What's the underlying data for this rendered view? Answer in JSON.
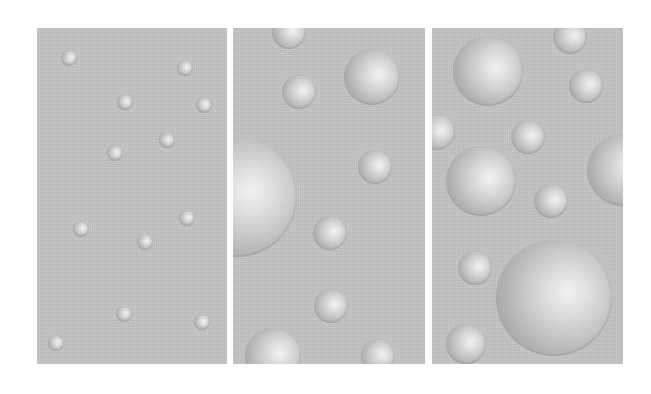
{
  "figure": {
    "background": "#ffffff",
    "panel_color": "#c3c3c3",
    "sphere_highlight": "#f2f2f2",
    "sphere_shadow": "#8f8f8f",
    "panels": [
      {
        "name": "panel-small-spheres",
        "x": 37,
        "y": 28,
        "width": 190,
        "height": 336,
        "spheres": [
          {
            "cx": 69,
            "cy": 58,
            "r": 8
          },
          {
            "cx": 185,
            "cy": 68,
            "r": 8
          },
          {
            "cx": 125,
            "cy": 102,
            "r": 8
          },
          {
            "cx": 204,
            "cy": 105,
            "r": 8
          },
          {
            "cx": 167,
            "cy": 140,
            "r": 8
          },
          {
            "cx": 115,
            "cy": 153,
            "r": 8
          },
          {
            "cx": 187,
            "cy": 218,
            "r": 8
          },
          {
            "cx": 81,
            "cy": 229,
            "r": 8
          },
          {
            "cx": 145,
            "cy": 242,
            "r": 8
          },
          {
            "cx": 124,
            "cy": 314,
            "r": 8
          },
          {
            "cx": 202,
            "cy": 322,
            "r": 8
          },
          {
            "cx": 56,
            "cy": 343,
            "r": 8
          }
        ]
      },
      {
        "name": "panel-medium-spheres",
        "x": 233,
        "y": 28,
        "width": 192,
        "height": 336,
        "spheres": [
          {
            "cx": 289,
            "cy": 32,
            "r": 17
          },
          {
            "cx": 372,
            "cy": 77,
            "r": 28
          },
          {
            "cx": 299,
            "cy": 92,
            "r": 17
          },
          {
            "cx": 237,
            "cy": 197,
            "r": 60
          },
          {
            "cx": 375,
            "cy": 167,
            "r": 17
          },
          {
            "cx": 330,
            "cy": 233,
            "r": 17
          },
          {
            "cx": 331,
            "cy": 306,
            "r": 17
          },
          {
            "cx": 273,
            "cy": 356,
            "r": 28
          },
          {
            "cx": 378,
            "cy": 356,
            "r": 17
          }
        ]
      },
      {
        "name": "panel-large-spheres",
        "x": 432,
        "y": 28,
        "width": 191,
        "height": 336,
        "spheres": [
          {
            "cx": 488,
            "cy": 71,
            "r": 35
          },
          {
            "cx": 570,
            "cy": 37,
            "r": 17
          },
          {
            "cx": 586,
            "cy": 86,
            "r": 17
          },
          {
            "cx": 437,
            "cy": 132,
            "r": 18
          },
          {
            "cx": 528,
            "cy": 137,
            "r": 17
          },
          {
            "cx": 481,
            "cy": 181,
            "r": 35
          },
          {
            "cx": 623,
            "cy": 170,
            "r": 36
          },
          {
            "cx": 551,
            "cy": 201,
            "r": 17
          },
          {
            "cx": 475,
            "cy": 268,
            "r": 17
          },
          {
            "cx": 554,
            "cy": 298,
            "r": 58
          },
          {
            "cx": 466,
            "cy": 344,
            "r": 20
          }
        ]
      }
    ]
  }
}
